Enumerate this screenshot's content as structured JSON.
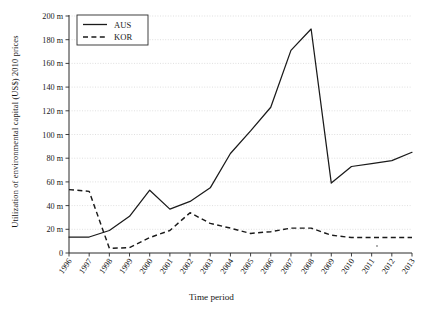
{
  "chart_data": {
    "type": "line",
    "title": "",
    "xlabel": "Time period",
    "ylabel": "Utilization of environmental capital (US$) 2010 prices",
    "categories": [
      "1996",
      "1997",
      "1998",
      "1999",
      "2000",
      "2001",
      "2002",
      "2003",
      "2004",
      "2005",
      "2006",
      "2007",
      "2008",
      "2009",
      "2010",
      "2011",
      "2012",
      "2013"
    ],
    "ylim": [
      0,
      200
    ],
    "ytick_labels": [
      "0",
      "20 m",
      "40 m",
      "60 m",
      "80 m",
      "100 m",
      "120 m",
      "140 m",
      "160 m",
      "180 m",
      "200 m"
    ],
    "ytick_values": [
      0,
      20,
      40,
      60,
      80,
      100,
      120,
      140,
      160,
      180,
      200
    ],
    "grid": true,
    "legend_position": "top-left",
    "series": [
      {
        "name": "AUS",
        "style": "solid",
        "color": "#1a1a1a",
        "values": [
          13.5,
          13.5,
          19.0,
          31.0,
          53.0,
          37.0,
          43.5,
          55.0,
          84.0,
          103.0,
          123.0,
          171.0,
          189.0,
          59.0,
          73.0,
          75.5,
          78.0,
          85.0
        ]
      },
      {
        "name": "KOR",
        "style": "dashed",
        "color": "#1a1a1a",
        "values": [
          53.5,
          52.0,
          4.0,
          4.5,
          13.0,
          19.0,
          34.0,
          25.0,
          21.0,
          16.5,
          18.0,
          21.0,
          21.0,
          15.0,
          13.0,
          13.0,
          13.0,
          13.0
        ]
      }
    ]
  },
  "legend": {
    "entries": [
      {
        "label": "AUS"
      },
      {
        "label": "KOR"
      }
    ]
  },
  "axes": {
    "y_title": "Utilization of environmental capital (US$) 2010 prices",
    "x_title": "Time period"
  }
}
